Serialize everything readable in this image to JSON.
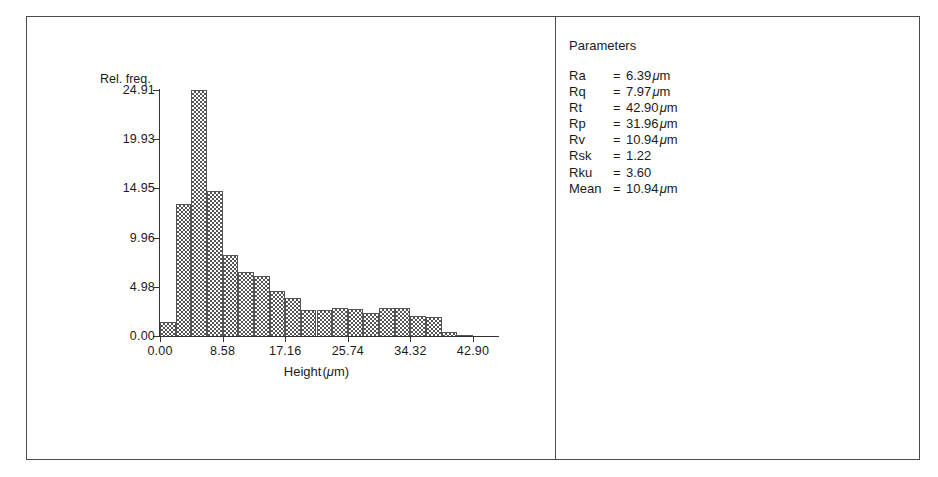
{
  "chart_data": {
    "type": "bar",
    "title": "",
    "xlabel": "Height (μm)",
    "ylabel": "Rel. freq.",
    "xlim": [
      0.0,
      42.9
    ],
    "ylim": [
      0.0,
      24.91
    ],
    "grid": false,
    "legend": "none",
    "bin_width": 2.145,
    "x_ticks": [
      "0.00",
      "8.58",
      "17.16",
      "25.74",
      "34.32",
      "42.90"
    ],
    "x_tick_values": [
      0.0,
      8.58,
      17.16,
      25.74,
      34.32,
      42.9
    ],
    "y_ticks": [
      "0.00",
      "4.98",
      "9.96",
      "14.95",
      "19.93",
      "24.91"
    ],
    "y_tick_values": [
      0.0,
      4.98,
      9.96,
      14.95,
      19.93,
      24.91
    ],
    "bin_starts": [
      0.0,
      2.15,
      4.29,
      6.44,
      8.58,
      10.73,
      12.87,
      15.02,
      17.16,
      19.31,
      21.45,
      23.6,
      25.74,
      27.89,
      30.03,
      32.18,
      34.32,
      36.47,
      38.61,
      40.76
    ],
    "categories": [
      "0.00-2.15",
      "2.15-4.29",
      "4.29-6.44",
      "6.44-8.58",
      "8.58-10.73",
      "10.73-12.87",
      "12.87-15.02",
      "15.02-17.16",
      "17.16-19.31",
      "19.31-21.45",
      "21.45-23.60",
      "23.60-25.74",
      "25.74-27.89",
      "27.89-30.03",
      "30.03-32.18",
      "32.18-34.32",
      "34.32-36.47",
      "36.47-38.61",
      "38.61-40.76",
      "40.76-42.90"
    ],
    "values": [
      1.4,
      13.4,
      24.91,
      14.7,
      8.2,
      6.5,
      6.1,
      4.6,
      3.9,
      2.6,
      2.6,
      2.8,
      2.7,
      2.3,
      2.8,
      2.8,
      2.0,
      1.9,
      0.4,
      0.15
    ],
    "axis_color": "#333333",
    "bar_fill": "#555555"
  },
  "parameters": {
    "title": "Parameters",
    "rows": [
      {
        "key": "Ra",
        "eq": "=",
        "value": "6.39",
        "unit": "μm"
      },
      {
        "key": "Rq",
        "eq": "=",
        "value": "7.97",
        "unit": "μm"
      },
      {
        "key": "Rt",
        "eq": "=",
        "value": "42.90",
        "unit": "μm"
      },
      {
        "key": "Rp",
        "eq": "=",
        "value": "31.96",
        "unit": "μm"
      },
      {
        "key": "Rv",
        "eq": "=",
        "value": "10.94",
        "unit": "μm"
      },
      {
        "key": "Rsk",
        "eq": "=",
        "value": "1.22",
        "unit": ""
      },
      {
        "key": "Rku",
        "eq": "=",
        "value": "3.60",
        "unit": ""
      },
      {
        "key": "Mean",
        "eq": "=",
        "value": "10.94",
        "unit": "μm"
      }
    ]
  }
}
